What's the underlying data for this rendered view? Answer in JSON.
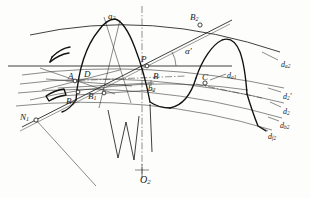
{
  "figure": {
    "type": "engineering-diagram",
    "background_color": "#fdfdfc",
    "line_color": "#1b1b1b",
    "thin_line_color": "#3a3a3a"
  },
  "labels": {
    "a2": {
      "base": "a",
      "sub": "2",
      "prime": "",
      "x": 108,
      "y": 12,
      "size": "s9"
    },
    "B2_top": {
      "base": "B",
      "sub": "2",
      "prime": "",
      "x": 190,
      "y": 13,
      "size": "s9"
    },
    "alpha": {
      "base": "α",
      "sub": "",
      "prime": "′",
      "x": 185,
      "y": 47,
      "size": "s9"
    },
    "da2": {
      "base": "d",
      "sub": "a2",
      "prime": "",
      "x": 281,
      "y": 61,
      "size": "s8"
    },
    "P": {
      "base": "P",
      "sub": "",
      "prime": "",
      "x": 141,
      "y": 55,
      "size": "s9"
    },
    "D": {
      "base": "D",
      "sub": "",
      "prime": "",
      "x": 84,
      "y": 70,
      "size": "s9"
    },
    "A": {
      "base": "A",
      "sub": "",
      "prime": "",
      "x": 68,
      "y": 72,
      "size": "s9"
    },
    "B": {
      "base": "B",
      "sub": "",
      "prime": "",
      "x": 153,
      "y": 72,
      "size": "s9"
    },
    "C": {
      "base": "C",
      "sub": "",
      "prime": "",
      "x": 202,
      "y": 73,
      "size": "s9"
    },
    "da1": {
      "base": "d",
      "sub": "a1",
      "prime": "",
      "x": 227,
      "y": 72,
      "size": "s8"
    },
    "b2": {
      "base": "b",
      "sub": "2",
      "prime": "",
      "x": 148,
      "y": 84,
      "size": "s9"
    },
    "B1": {
      "base": "B",
      "sub": "1",
      "prime": "",
      "x": 88,
      "y": 92,
      "size": "s9"
    },
    "B3": {
      "base": "B",
      "sub": "1",
      "prime": "",
      "x": 66,
      "y": 97,
      "size": "s9"
    },
    "d2p": {
      "base": "d",
      "sub": "2",
      "prime": "′",
      "x": 283,
      "y": 93,
      "size": "s8"
    },
    "d2": {
      "base": "d",
      "sub": "2",
      "prime": "",
      "x": 283,
      "y": 108,
      "size": "s8"
    },
    "db2": {
      "base": "d",
      "sub": "b2",
      "prime": "",
      "x": 280,
      "y": 122,
      "size": "s8"
    },
    "df2": {
      "base": "d",
      "sub": "f2",
      "prime": "",
      "x": 268,
      "y": 133,
      "size": "s8"
    },
    "N1": {
      "base": "N",
      "sub": "1",
      "prime": "",
      "x": 20,
      "y": 113,
      "size": "s9"
    },
    "O2": {
      "base": "O",
      "sub": "2",
      "prime": "",
      "x": 140,
      "y": 175,
      "size": "s10"
    }
  },
  "points": [
    {
      "name": "P",
      "x": 147,
      "y": 66,
      "style": "open"
    },
    {
      "name": "B2",
      "x": 200,
      "y": 25,
      "style": "open"
    },
    {
      "name": "C",
      "x": 205,
      "y": 83,
      "style": "open"
    },
    {
      "name": "B",
      "x": 151,
      "y": 83,
      "style": "cross"
    },
    {
      "name": "D",
      "x": 75,
      "y": 81,
      "style": "open"
    },
    {
      "name": "B1",
      "x": 104,
      "y": 93,
      "style": "open"
    },
    {
      "name": "B3",
      "x": 78,
      "y": 92,
      "style": "open"
    },
    {
      "name": "N1",
      "x": 36,
      "y": 120,
      "style": "open"
    },
    {
      "name": "O2",
      "x": 142,
      "y": 170,
      "style": "cross"
    }
  ],
  "arcs": [
    {
      "name": "d_a2-addendum-circle-gear2"
    },
    {
      "name": "d_2prime-pitch-circle"
    },
    {
      "name": "d_2-reference-circle"
    },
    {
      "name": "d_b2-base-circle"
    },
    {
      "name": "d_f2-dedendum-circle"
    },
    {
      "name": "d_a1-addendum-arc-gear1"
    }
  ],
  "teeth": [
    {
      "name": "tooth-left-partial"
    },
    {
      "name": "tooth-center-main"
    },
    {
      "name": "tooth-right-partial"
    },
    {
      "name": "tooth-far-right-partial"
    }
  ],
  "lines": [
    {
      "name": "line-of-action-N1-B2"
    },
    {
      "name": "pitch-line-horizontal"
    },
    {
      "name": "center-line-vertical-O2"
    },
    {
      "name": "radial-line-O2-N1"
    },
    {
      "name": "tooth-axis-a2"
    }
  ]
}
